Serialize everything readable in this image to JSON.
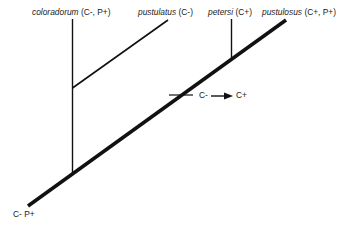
{
  "diagram": {
    "type": "phylogenetic-tree",
    "colors": {
      "line": "#111111",
      "text": "#1a1a1a",
      "background": "#ffffff"
    },
    "taxa": [
      {
        "name": "coloradorum",
        "traits": "(C-, P+)"
      },
      {
        "name": "pustulatus",
        "traits": "(C-)"
      },
      {
        "name": "petersi",
        "traits": "(C+)"
      },
      {
        "name": "pustulosus",
        "traits": "(C+, P+)"
      }
    ],
    "root_label": "C- P+",
    "transition": {
      "from": "C-",
      "to": "C+"
    }
  }
}
